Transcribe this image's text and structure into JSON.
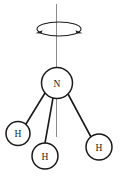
{
  "figure": {
    "type": "chemical-structure-diagram",
    "background_color": "#ffffff",
    "stroke_color": "#1a1a1a",
    "axis_color": "#8a8a8a",
    "label_color": "#1a1a1a"
  },
  "rotation_axis": {
    "name": "principal-rotation-axis",
    "x": 56.5,
    "y_top": 4,
    "y_bottom": 137,
    "color": "#8a8a8a",
    "width": 1
  },
  "rotation_arrow": {
    "name": "rotation-direction-ellipse",
    "center_x": 59,
    "center_y": 29,
    "radius_x": 22,
    "radius_y": 7,
    "arrowheads": [
      "left",
      "right"
    ],
    "color": "#1a1a1a"
  },
  "atoms": [
    {
      "id": "nitrogen",
      "label": "N",
      "cx": 57,
      "cy": 83,
      "r": 15.5,
      "fill": "#ffffff",
      "stroke": "#1a1a1a"
    },
    {
      "id": "hydrogen-left",
      "label": "H",
      "cx": 18,
      "cy": 133.5,
      "r": 12,
      "fill": "#ffffff",
      "stroke": "#1a1a1a"
    },
    {
      "id": "hydrogen-bottom",
      "label": "H",
      "cx": 45,
      "cy": 156,
      "r": 13,
      "fill": "#ffffff",
      "stroke": "#1a1a1a"
    },
    {
      "id": "hydrogen-right",
      "label": "H",
      "cx": 99,
      "cy": 147,
      "r": 13,
      "fill": "#ffffff",
      "stroke": "#1a1a1a"
    }
  ],
  "bonds": [
    {
      "id": "bond-n-h-left",
      "from": "nitrogen",
      "to": "hydrogen-left",
      "x1": 45,
      "y1": 93,
      "x2": 26,
      "y2": 124,
      "width": 1.6
    },
    {
      "id": "bond-n-h-bottom",
      "from": "nitrogen",
      "to": "hydrogen-bottom",
      "x1": 53,
      "y1": 98,
      "x2": 45,
      "y2": 143,
      "width": 1.6
    },
    {
      "id": "bond-n-h-right",
      "from": "nitrogen",
      "to": "hydrogen-right",
      "x1": 68,
      "y1": 94,
      "x2": 91,
      "y2": 137,
      "width": 1.6
    }
  ]
}
